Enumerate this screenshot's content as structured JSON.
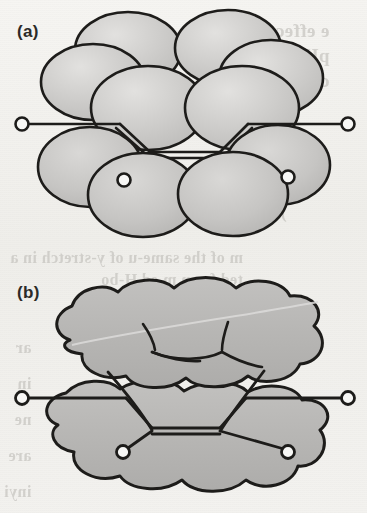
{
  "figure": {
    "kind": "scanned-textbook-illustration",
    "panels": [
      {
        "id": "a",
        "label": "(a)",
        "description": "Overlapping ellipsoidal p-orbital lobes drawn as discrete shaded spheres above and below the sigma framework",
        "lobe_count": 12,
        "atoms": [
          {
            "name": "hydrogen-left-upper",
            "cx": 22,
            "cy": 124,
            "r": 6.5
          },
          {
            "name": "hydrogen-right-upper",
            "cx": 348,
            "cy": 124,
            "r": 6.5
          },
          {
            "name": "hydrogen-left-lower",
            "cx": 124,
            "cy": 180,
            "r": 6.5
          },
          {
            "name": "hydrogen-right-lower",
            "cx": 288,
            "cy": 177,
            "r": 6.5
          }
        ]
      },
      {
        "id": "b",
        "label": "(b)",
        "description": "Merged continuous pi-electron clouds above and below the molecular plane with bond skeleton visible through the cloud",
        "atoms": [
          {
            "name": "hydrogen-left-upper",
            "cx": 22,
            "cy": 398,
            "r": 6.5
          },
          {
            "name": "hydrogen-right-upper",
            "cx": 348,
            "cy": 398,
            "r": 6.5
          },
          {
            "name": "hydrogen-left-lower",
            "cx": 123,
            "cy": 452,
            "r": 6.5
          },
          {
            "name": "hydrogen-right-lower",
            "cx": 288,
            "cy": 452,
            "r": 6.5
          }
        ]
      }
    ]
  },
  "colors": {
    "paper": "#f2f1ee",
    "ink": "#1d1c1a",
    "lobe_fill": "#c9c8c6",
    "lobe_fill_light": "#dddcda",
    "cloud_fill": "#b9b8b6",
    "ghost_text": "#b9b7b2",
    "atom_fill": "#f7f7f5"
  },
  "ghost_text": {
    "note": "faint mirrored bleed-through text from the reverse side of the scanned page",
    "right_column": [
      "e effect i",
      "pH i",
      "cra",
      "re",
      "no",
      "d a",
      ") is"
    ],
    "mid_column": [
      "m of the same-u of y-stretch in a",
      "ted from m    ed H-bo",
      "indin        g",
      "erro"
    ],
    "left_column": [
      "ar",
      "in",
      "ne",
      "are",
      "inyi"
    ]
  }
}
